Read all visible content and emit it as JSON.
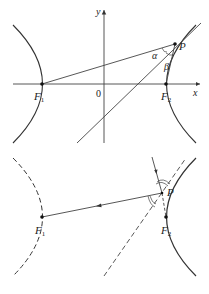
{
  "figure_top": {
    "axes": {
      "x_label": "x",
      "y_label": "y",
      "origin_label": "0"
    },
    "points": {
      "F1": {
        "label": "F",
        "sub": "1"
      },
      "F2": {
        "label": "F",
        "sub": "2"
      },
      "P": {
        "label": "P"
      }
    },
    "angles": {
      "alpha": "α",
      "beta": "β"
    },
    "description": "Hyperbola with foci F1, F2; tangent line at P bisects angle F1PF2 (angles α and β)"
  },
  "figure_bottom": {
    "points": {
      "F1": {
        "label": "F",
        "sub": "1"
      },
      "F2": {
        "label": "F",
        "sub": "2"
      },
      "P": {
        "label": "P"
      }
    },
    "description": "Reflection property: ray aimed at F2 reflects off hyperbola at P toward F1"
  },
  "colors": {
    "stroke": "#333333",
    "background": "#ffffff"
  }
}
